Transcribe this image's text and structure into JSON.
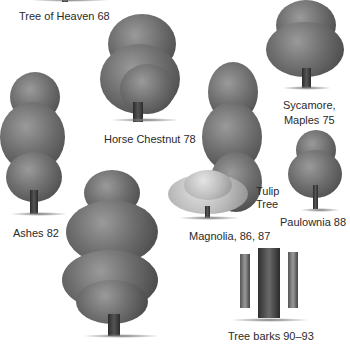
{
  "page": {
    "type": "illustrated tree index",
    "entries": [
      {
        "id": "tree-of-heaven",
        "label": "Tree of Heaven 68"
      },
      {
        "id": "horse-chestnut",
        "label": "Horse Chestnut 78"
      },
      {
        "id": "sycamore-maples",
        "label_line1": "Sycamore,",
        "label_line2": "Maples 75"
      },
      {
        "id": "ashes",
        "label": "Ashes 82"
      },
      {
        "id": "tulip-tree",
        "label_line1": "Tulip",
        "label_line2": "Tree"
      },
      {
        "id": "paulownia",
        "label": "Paulownia 88"
      },
      {
        "id": "magnolia",
        "label": "Magnolia, 86, 87"
      },
      {
        "id": "tree-barks",
        "label": "Tree barks 90–93"
      }
    ]
  }
}
